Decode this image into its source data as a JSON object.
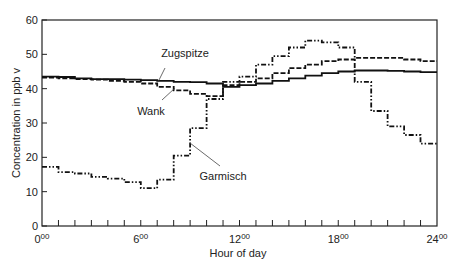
{
  "chart_data": {
    "type": "line",
    "title": "",
    "xlabel": "Hour of day",
    "ylabel": "Concentration in ppb v",
    "xlim": [
      0,
      24
    ],
    "ylim": [
      0,
      60
    ],
    "x_ticks": [
      {
        "v": 0,
        "label": "0",
        "sup": "00"
      },
      {
        "v": 6,
        "label": "6",
        "sup": "00"
      },
      {
        "v": 12,
        "label": "12",
        "sup": "00"
      },
      {
        "v": 18,
        "label": "18",
        "sup": "00"
      },
      {
        "v": 24,
        "label": "24",
        "sup": "00"
      }
    ],
    "y_ticks": [
      0,
      10,
      20,
      30,
      40,
      50,
      60
    ],
    "grid": false,
    "step": true,
    "x": [
      0,
      1,
      2,
      3,
      4,
      5,
      6,
      7,
      8,
      9,
      10,
      11,
      12,
      13,
      14,
      15,
      16,
      17,
      18,
      19,
      20,
      21,
      22,
      23
    ],
    "series": [
      {
        "name": "Zugspitze",
        "style": "solid",
        "label_pos": [
          17.5,
          44.5
        ],
        "values": [
          43.5,
          43.4,
          43.0,
          42.8,
          42.8,
          42.6,
          42.5,
          42.3,
          42.0,
          41.9,
          41.5,
          40.5,
          41.0,
          41.5,
          42.3,
          43.0,
          43.8,
          44.5,
          45.0,
          45.3,
          45.3,
          45.2,
          45.0,
          44.8
        ]
      },
      {
        "name": "Wank",
        "style": "dashed",
        "label_pos": [
          7.5,
          38
        ],
        "values": [
          43.2,
          43.0,
          42.8,
          42.6,
          42.3,
          42.0,
          41.5,
          40.5,
          39.5,
          38.5,
          37.8,
          41.0,
          42.0,
          43.0,
          44.5,
          46.0,
          47.0,
          48.0,
          48.5,
          49.0,
          49.0,
          49.0,
          48.5,
          48.0
        ]
      },
      {
        "name": "Garmisch",
        "style": "dashdot",
        "label_pos": [
          9.8,
          14
        ],
        "values": [
          17.2,
          15.7,
          15.3,
          14.3,
          13.8,
          12.8,
          11.0,
          13.5,
          20.5,
          28.5,
          37.0,
          42.0,
          43.5,
          47.0,
          49.5,
          52.0,
          54.0,
          53.5,
          52.0,
          42.0,
          33.5,
          29.0,
          26.5,
          24.0
        ]
      }
    ],
    "annotations": [
      {
        "text": "Zugspitze",
        "x": 185,
        "y": 57,
        "lx1": 165,
        "ly1": 68,
        "lx2": 158,
        "ly2": 82
      },
      {
        "text": "Wank",
        "x": 151,
        "y": 115,
        "lx1": 162,
        "ly1": 100,
        "lx2": 175,
        "ly2": 88
      },
      {
        "text": "Garmisch",
        "x": 223,
        "y": 180,
        "lx1": 220,
        "ly1": 166,
        "lx2": 190,
        "ly2": 143
      }
    ]
  }
}
